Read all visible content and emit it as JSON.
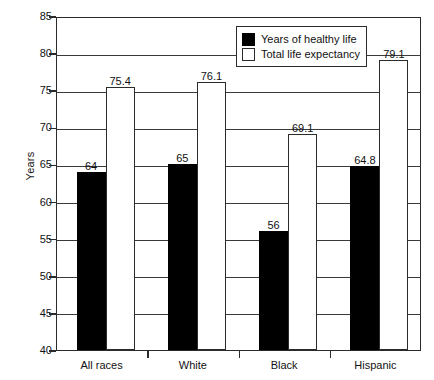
{
  "chart_data": {
    "type": "bar",
    "title": "",
    "xlabel": "",
    "ylabel": "Years",
    "ylim": [
      40,
      85
    ],
    "ytick_step": 5,
    "yticks": [
      40,
      45,
      50,
      55,
      60,
      65,
      70,
      75,
      80,
      85
    ],
    "grid": true,
    "legend_position": "top-right",
    "categories": [
      "All races",
      "White",
      "Black",
      "Hispanic"
    ],
    "series": [
      {
        "name": "Years of healthy life",
        "color": "#000000",
        "values": [
          64,
          65,
          56,
          64.8
        ],
        "labels": [
          "64",
          "65",
          "56",
          "64.8"
        ]
      },
      {
        "name": "Total life expectancy",
        "color": "#ffffff",
        "values": [
          75.4,
          76.1,
          69.1,
          79.1
        ],
        "labels": [
          "75.4",
          "76.1",
          "69.1",
          "79.1"
        ]
      }
    ]
  },
  "axis": {
    "y_title": "Years",
    "y_tick_labels": [
      "85",
      "80",
      "75",
      "70",
      "65",
      "60",
      "55",
      "50",
      "45",
      "40"
    ],
    "x_tick_labels": [
      "All races",
      "White",
      "Black",
      "Hispanic"
    ]
  },
  "legend": {
    "items": [
      {
        "label": "Years of healthy life",
        "swatch": "dark"
      },
      {
        "label": "Total life expectancy",
        "swatch": "light"
      }
    ]
  }
}
